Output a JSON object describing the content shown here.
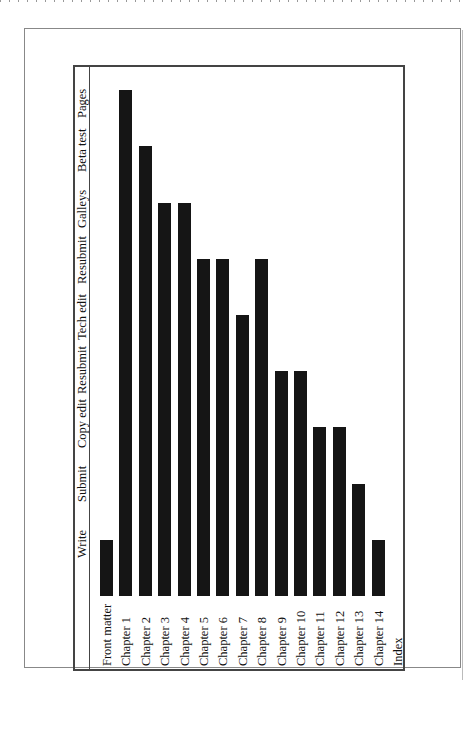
{
  "chart_data": {
    "type": "bar",
    "orientation": "rotated-90",
    "title": "",
    "xlabel": "",
    "ylabel": "",
    "categories": [
      "Front matter",
      "Chapter 1",
      "Chapter 2",
      "Chapter 3",
      "Chapter 4",
      "Chapter 5",
      "Chapter 6",
      "Chapter 7",
      "Chapter 8",
      "Chapter 9",
      "Chapter 10",
      "Chapter 11",
      "Chapter 12",
      "Chapter 13",
      "Chapter 14",
      "Index"
    ],
    "stage_ticks": [
      "Write",
      "Submit",
      "Copy edit",
      "Resubmit",
      "Tech edit",
      "Resubmit",
      "Galleys",
      "Beta test",
      "Pages"
    ],
    "values": [
      1,
      9,
      8,
      7,
      7,
      6,
      6,
      5,
      6,
      4,
      4,
      3,
      3,
      2,
      1,
      0
    ],
    "value_meaning": "index of furthest production stage reached (1=Write ... 9=Pages)",
    "ylim": [
      0,
      9
    ],
    "grid": false,
    "legend": "none"
  },
  "stages": [
    "Write",
    "Submit",
    "Copy edit",
    "Resubmit",
    "Tech edit",
    "Resubmit",
    "Galleys",
    "Beta test",
    "Pages"
  ],
  "items": [
    "Front matter",
    "Chapter 1",
    "Chapter 2",
    "Chapter 3",
    "Chapter 4",
    "Chapter 5",
    "Chapter 6",
    "Chapter 7",
    "Chapter 8",
    "Chapter 9",
    "Chapter 10",
    "Chapter 11",
    "Chapter 12",
    "Chapter 13",
    "Chapter 14",
    "Index"
  ],
  "bar_color": "#151515"
}
